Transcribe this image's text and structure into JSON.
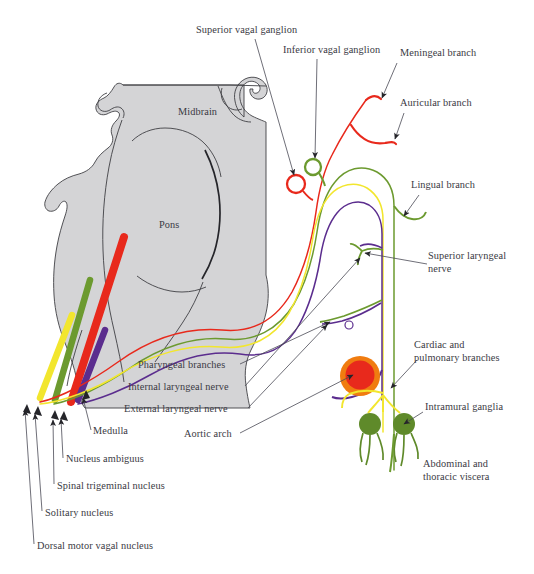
{
  "figure": {
    "background_color": "#ffffff"
  },
  "colors": {
    "brain_fill": "#d4d4d6",
    "brain_outline": "#3f3f44",
    "label_text": "#3a3a44",
    "leader_line": "#4a4a55",
    "nucleus_ambiguus_red": "#e8291c",
    "spinal_trigeminal_green": "#6c9a2f",
    "solitary_yellow": "#f2e62e",
    "dorsal_motor_purple": "#5b2d8e",
    "aortic_arch_ring": "#f07c10",
    "aortic_arch_core": "#e8291c",
    "intramural_ganglia": "#5f8a2a",
    "superior_ganglion_ring": "#e8291c",
    "inferior_ganglion_ring": "#6c9a2f"
  },
  "brain_labels": [
    {
      "id": "midbrain",
      "text": "Midbrain",
      "x": 178,
      "y": 115
    },
    {
      "id": "pons",
      "text": "Pons",
      "x": 159,
      "y": 228
    }
  ],
  "callouts": [
    {
      "id": "superior-vagal-ganglion",
      "text": "Superior vagal ganglion",
      "lines": [
        "Superior vagal ganglion"
      ],
      "text_x": 196,
      "text_y": 33,
      "anchor": "start",
      "leader": "M 255 39 L 294 175",
      "arrow_at": [
        294,
        175
      ],
      "arrow_angle": 74
    },
    {
      "id": "inferior-vagal-ganglion",
      "text": "Inferior vagal ganglion",
      "lines": [
        "Inferior vagal ganglion"
      ],
      "text_x": 283,
      "text_y": 53,
      "anchor": "start",
      "leader": "M 317 59 L 315 158",
      "arrow_at": [
        315,
        160
      ],
      "arrow_angle": 88
    },
    {
      "id": "meningeal-branch",
      "text": "Meningeal branch",
      "lines": [
        "Meningeal branch"
      ],
      "text_x": 400,
      "text_y": 56,
      "anchor": "start",
      "leader": "M 397 63 L 382 98",
      "arrow_at": [
        380,
        100
      ],
      "arrow_angle": 113
    },
    {
      "id": "auricular-branch",
      "text": "Auricular branch",
      "lines": [
        "Auricular branch"
      ],
      "text_x": 400,
      "text_y": 106,
      "anchor": "start",
      "leader": "M 404 113 L 395 139",
      "arrow_at": [
        393,
        141
      ],
      "arrow_angle": 110
    },
    {
      "id": "lingual-branch",
      "text": "Lingual branch",
      "lines": [
        "Lingual branch"
      ],
      "text_x": 411,
      "text_y": 188,
      "anchor": "start",
      "leader": "M 419 195 L 404 216",
      "arrow_at": [
        402,
        218
      ],
      "arrow_angle": 125
    },
    {
      "id": "superior-laryngeal-nerve",
      "text": "Superior laryngeal nerve",
      "lines": [
        "Superior laryngeal",
        "nerve"
      ],
      "text_x": 428,
      "text_y": 259,
      "anchor": "start",
      "leader": "M 427 264 L 365 253",
      "arrow_at": [
        363,
        253
      ],
      "arrow_angle": 190
    },
    {
      "id": "cardiac-and-pulmonary-branches",
      "text": "Cardiac and pulmonary branches",
      "lines": [
        "Cardiac and",
        "pulmonary branches"
      ],
      "text_x": 414,
      "text_y": 348,
      "anchor": "start",
      "leader": "M 417 360 L 391 388",
      "arrow_at": [
        389,
        390
      ],
      "arrow_angle": 133
    },
    {
      "id": "intramural-ganglia",
      "text": "Intramural ganglia",
      "lines": [
        "Intramural ganglia"
      ],
      "text_x": 425,
      "text_y": 410,
      "anchor": "start",
      "leader": "M 423 412 L 404 424",
      "arrow_at": [
        402,
        426
      ],
      "arrow_angle": 148
    },
    {
      "id": "abdominal-and-thoracic-viscera",
      "text": "Abdominal and thoracic viscera",
      "lines": [
        "Abdominal and",
        "thoracic viscera"
      ],
      "text_x": 423,
      "text_y": 467,
      "anchor": "start",
      "leader": "",
      "arrow_at": null,
      "arrow_angle": 0
    },
    {
      "id": "pharyngeal-branches",
      "text": "Pharyngeal branches",
      "lines": [
        "Pharyngeal branches"
      ],
      "text_x": 138,
      "text_y": 368,
      "anchor": "start",
      "leader": "M 240 364 L 330 322",
      "arrow_at": [
        332,
        321
      ],
      "arrow_angle": -25
    },
    {
      "id": "internal-laryngeal-nerve",
      "text": "Internal laryngeal nerve",
      "lines": [
        "Internal laryngeal nerve"
      ],
      "text_x": 128,
      "text_y": 390,
      "anchor": "start",
      "leader": "M 245 386 L 360 258",
      "arrow_at": [
        362,
        256
      ],
      "arrow_angle": -48
    },
    {
      "id": "external-laryngeal-nerve",
      "text": "External laryngeal nerve",
      "lines": [
        "External laryngeal nerve"
      ],
      "text_x": 124,
      "text_y": 412,
      "anchor": "start",
      "leader": "M 248 408 L 327 325",
      "arrow_at": [
        329,
        323
      ],
      "arrow_angle": -46
    },
    {
      "id": "aortic-arch",
      "text": "Aortic arch",
      "lines": [
        "Aortic arch"
      ],
      "text_x": 184,
      "text_y": 437,
      "anchor": "start",
      "leader": "M 240 433 L 353 375",
      "arrow_at": [
        356,
        373
      ],
      "arrow_angle": -27
    },
    {
      "id": "medulla",
      "text": "Medulla",
      "lines": [
        "Medulla"
      ],
      "text_x": 93,
      "text_y": 434,
      "anchor": "start",
      "leader": "M 91 430 L 83 398",
      "arrow_at": [
        82,
        396
      ],
      "arrow_angle": 104
    },
    {
      "id": "nucleus-ambiguus",
      "text": "Nucleus ambiguus",
      "lines": [
        "Nucleus ambiguus"
      ],
      "text_x": 66,
      "text_y": 462,
      "anchor": "start",
      "leader": "M 63 458 L 61 419",
      "arrow_at": [
        60,
        417
      ],
      "arrow_angle": 93
    },
    {
      "id": "spinal-trigeminal-nucleus",
      "text": "Spinal trigeminal nucleus",
      "lines": [
        "Spinal trigeminal nucleus"
      ],
      "text_x": 57,
      "text_y": 489,
      "anchor": "start",
      "leader": "M 54 484 L 53 420",
      "arrow_at": [
        52,
        418
      ],
      "arrow_angle": 92
    },
    {
      "id": "solitary-nucleus",
      "text": "Solitary nucleus",
      "lines": [
        "Solitary nucleus"
      ],
      "text_x": 45,
      "text_y": 516,
      "anchor": "start",
      "leader": "M 42 511 L 35 414",
      "arrow_at": [
        34,
        412
      ],
      "arrow_angle": 96
    },
    {
      "id": "dorsal-motor-vagal-nucleus",
      "text": "Dorsal motor vagal nucleus",
      "lines": [
        "Dorsal motor vagal nucleus"
      ],
      "text_x": 37,
      "text_y": 549,
      "anchor": "start",
      "leader": "M 34 544 L 25 410",
      "arrow_at": [
        24,
        408
      ],
      "arrow_angle": 94
    }
  ],
  "structures": {
    "nuclei": [
      {
        "id": "solitary-nucleus-bar",
        "color_key": "solitary_yellow",
        "label": "Solitary nucleus"
      },
      {
        "id": "spinal-trigeminal-nucleus-bar",
        "color_key": "spinal_trigeminal_green",
        "label": "Spinal trigeminal nucleus"
      },
      {
        "id": "nucleus-ambiguus-bar",
        "color_key": "nucleus_ambiguus_red",
        "label": "Nucleus ambiguus"
      },
      {
        "id": "dorsal-motor-vagal-nucleus-bar",
        "color_key": "dorsal_motor_purple",
        "label": "Dorsal motor vagal nucleus"
      }
    ],
    "ganglia": [
      {
        "id": "superior-vagal-ganglion-circle",
        "cx": 296,
        "cy": 184,
        "r": 9,
        "stroke": "#e8291c"
      },
      {
        "id": "inferior-vagal-ganglion-circle",
        "cx": 313,
        "cy": 167,
        "r": 8,
        "stroke": "#6c9a2f"
      }
    ],
    "aortic_arch": {
      "id": "aortic-arch-circle",
      "cx": 360,
      "cy": 376,
      "r_outer": 20,
      "r_inner": 15
    },
    "intramural_ganglia": [
      {
        "id": "intramural-ganglion-left",
        "cx": 370,
        "cy": 424,
        "r": 11
      },
      {
        "id": "intramural-ganglion-right",
        "cx": 404,
        "cy": 424,
        "r": 11
      }
    ]
  }
}
